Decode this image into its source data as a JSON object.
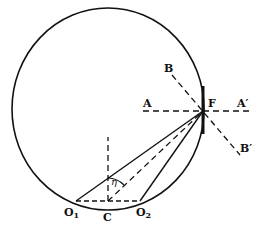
{
  "diagram": {
    "type": "geometric-optics",
    "colors": {
      "ink": "#111111",
      "background": "#ffffff"
    },
    "labels": {
      "A": "A",
      "A_prime": "A′",
      "B": "B",
      "B_prime": "B′",
      "F": "F",
      "C": "C",
      "O1_base": "O",
      "O1_sub": "1",
      "O2_base": "O",
      "O2_sub": "2",
      "eta": "η"
    },
    "elements": [
      "circle",
      "line A-A' (dashed, horizontal through F)",
      "line B-B' (dashed, diagonal through F)",
      "thick bar at F (tangent element)",
      "line O1-F (solid)",
      "line O2-F (solid)",
      "line C-F (dashed)",
      "line O1-O2 (dashed chord)",
      "vertical dashed line from C",
      "angle arc eta at C"
    ]
  }
}
